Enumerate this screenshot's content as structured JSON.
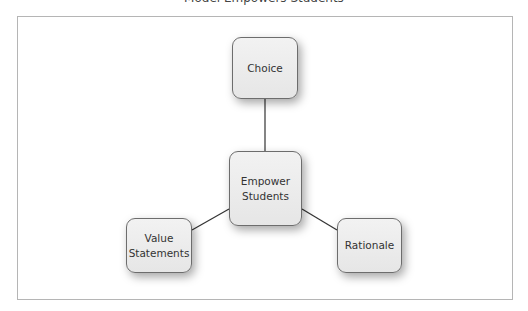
{
  "title": "Model Empowers Students",
  "diagram": {
    "center": {
      "label_line1": "Empower",
      "label_line2": "Students"
    },
    "nodes": [
      {
        "label": "Choice"
      },
      {
        "label_line1": "Value",
        "label_line2": "Statements"
      },
      {
        "label": "Rationale"
      }
    ],
    "colors": {
      "node_fill": "#ececec",
      "node_border": "#6d6d6d",
      "line": "#333333",
      "frame": "#b5b5b5"
    }
  }
}
